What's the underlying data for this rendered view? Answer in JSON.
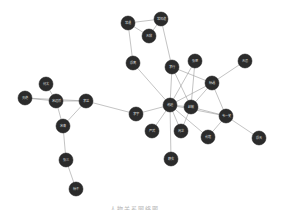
{
  "diagram": {
    "type": "network-graph",
    "node_radius": 7,
    "node_color": "#2b2b2b",
    "edge_color": "#9a9a9a",
    "caption": "人物关系网络图",
    "nodes": [
      {
        "id": "n1",
        "label": "常遇",
        "x": 128,
        "y": 23
      },
      {
        "id": "n2",
        "label": "常知道",
        "x": 161,
        "y": 19
      },
      {
        "id": "n3",
        "label": "无敌",
        "x": 149,
        "y": 36
      },
      {
        "id": "n4",
        "label": "殷离",
        "x": 133,
        "y": 63
      },
      {
        "id": "n5",
        "label": "李行",
        "x": 172,
        "y": 67
      },
      {
        "id": "n6",
        "label": "张翠",
        "x": 195,
        "y": 61
      },
      {
        "id": "n7",
        "label": "无忌",
        "x": 245,
        "y": 61
      },
      {
        "id": "n8",
        "label": "杨逍",
        "x": 212,
        "y": 83
      },
      {
        "id": "n9",
        "label": "谢逊",
        "x": 170,
        "y": 105
      },
      {
        "id": "n10",
        "label": "赵敏",
        "x": 191,
        "y": 107
      },
      {
        "id": "n11",
        "label": "韦一笑",
        "x": 226,
        "y": 116
      },
      {
        "id": "n12",
        "label": "李宇",
        "x": 136,
        "y": 114
      },
      {
        "id": "n13",
        "label": "严武",
        "x": 152,
        "y": 131
      },
      {
        "id": "n14",
        "label": "周芷",
        "x": 181,
        "y": 131
      },
      {
        "id": "n15",
        "label": "俞莲",
        "x": 208,
        "y": 137
      },
      {
        "id": "n16",
        "label": "殷天",
        "x": 259,
        "y": 138
      },
      {
        "id": "n17",
        "label": "静玄",
        "x": 171,
        "y": 159
      },
      {
        "id": "n18",
        "label": "何太",
        "x": 46,
        "y": 84
      },
      {
        "id": "n19",
        "label": "灭绝",
        "x": 25,
        "y": 98
      },
      {
        "id": "n20",
        "label": "宋远桥",
        "x": 56,
        "y": 101
      },
      {
        "id": "n21",
        "label": "李益",
        "x": 86,
        "y": 101
      },
      {
        "id": "n22",
        "label": "宋青",
        "x": 63,
        "y": 126
      },
      {
        "id": "n23",
        "label": "张三",
        "x": 66,
        "y": 160
      },
      {
        "id": "n24",
        "label": "杨不",
        "x": 76,
        "y": 189
      }
    ],
    "edges": [
      [
        "n1",
        "n2"
      ],
      [
        "n1",
        "n3"
      ],
      [
        "n3",
        "n2"
      ],
      [
        "n1",
        "n4"
      ],
      [
        "n2",
        "n5"
      ],
      [
        "n4",
        "n9"
      ],
      [
        "n5",
        "n9"
      ],
      [
        "n5",
        "n10"
      ],
      [
        "n5",
        "n8"
      ],
      [
        "n6",
        "n9"
      ],
      [
        "n7",
        "n8"
      ],
      [
        "n8",
        "n9"
      ],
      [
        "n8",
        "n10"
      ],
      [
        "n8",
        "n11"
      ],
      [
        "n9",
        "n10"
      ],
      [
        "n9",
        "n12"
      ],
      [
        "n9",
        "n13"
      ],
      [
        "n9",
        "n14"
      ],
      [
        "n9",
        "n15"
      ],
      [
        "n9",
        "n17"
      ],
      [
        "n9",
        "n11"
      ],
      [
        "n10",
        "n11"
      ],
      [
        "n10",
        "n14"
      ],
      [
        "n10",
        "n6"
      ],
      [
        "n11",
        "n15"
      ],
      [
        "n11",
        "n16"
      ],
      [
        "n12",
        "n21"
      ],
      [
        "n18",
        "n20"
      ],
      [
        "n19",
        "n20"
      ],
      [
        "n19",
        "n21"
      ],
      [
        "n20",
        "n21"
      ],
      [
        "n20",
        "n22"
      ],
      [
        "n21",
        "n22"
      ],
      [
        "n22",
        "n23"
      ],
      [
        "n23",
        "n24"
      ]
    ]
  }
}
